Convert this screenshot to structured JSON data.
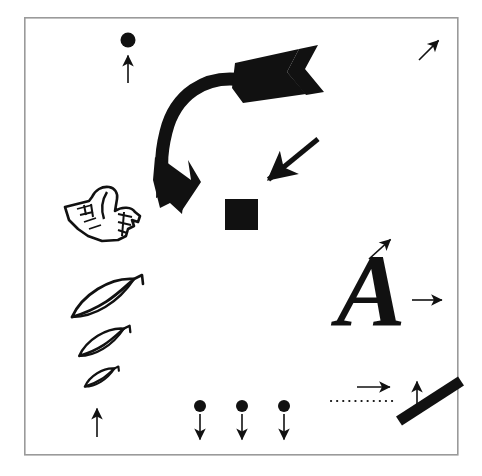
{
  "figure": {
    "background_color": "#ffffff",
    "ink_color": "#111111",
    "frame": {
      "name": "figure-border",
      "x": 24,
      "y": 17,
      "width": 434,
      "height": 438,
      "stroke_color": "#9a9a9a",
      "stroke_width": 1.6
    }
  },
  "elements": {
    "dot_top": {
      "label": "filled circle",
      "cx": 128,
      "cy": 40,
      "r": 7.5,
      "color": "#111111"
    },
    "arrow_under_dot_top": {
      "label": "thin arrow pointing up",
      "direction": "up",
      "x1": 128,
      "y1": 83,
      "x2": 128,
      "y2": 54,
      "stroke_width": 1.6
    },
    "arrow_small_topright": {
      "label": "thin arrow pointing up-right",
      "direction": "up-right",
      "x1": 419,
      "y1": 60,
      "x2": 440,
      "y2": 39,
      "stroke_width": 1.6
    },
    "curved_arrow": {
      "label": "large curved arrow with fletching, sweeping from upper right down to lower left",
      "direction": "down-left",
      "stroke_width": 13,
      "head_length": 46,
      "fletch_label": "feathered tail"
    },
    "arrow_thick_diagonal": {
      "label": "thick arrow pointing down-left",
      "direction": "down-left",
      "x1": 318,
      "y1": 139,
      "x2": 263,
      "y2": 184,
      "stroke_width": 5.5
    },
    "square_black": {
      "label": "filled black square",
      "x": 225,
      "y": 199,
      "width": 33,
      "height": 31,
      "color": "#111111"
    },
    "pointing_hand": {
      "label": "manicule pointing hand, index finger pointing left",
      "x": 62,
      "y": 186,
      "width": 80,
      "height": 58
    },
    "leaves": [
      {
        "label": "leaf large",
        "cx": 112,
        "cy": 299,
        "scale": 1.0
      },
      {
        "label": "leaf medium",
        "cx": 108,
        "cy": 343,
        "scale": 0.72
      },
      {
        "label": "leaf small",
        "cx": 104,
        "cy": 378,
        "scale": 0.48
      }
    ],
    "arrow_under_leaves": {
      "label": "thin arrow pointing up",
      "direction": "up",
      "x1": 97,
      "y1": 437,
      "x2": 97,
      "y2": 407,
      "stroke_width": 1.6
    },
    "dot_arrow_pairs": [
      {
        "label": "dot with arrow pointing down",
        "cx": 200,
        "cy": 406,
        "r": 6.0,
        "y1": 414,
        "y2": 441
      },
      {
        "label": "dot with arrow pointing down",
        "cx": 242,
        "cy": 406,
        "r": 6.0,
        "y1": 414,
        "y2": 441
      },
      {
        "label": "dot with arrow pointing down",
        "cx": 284,
        "cy": 406,
        "r": 6.0,
        "y1": 414,
        "y2": 441
      }
    ],
    "letter_a": {
      "label": "italic serif capital letter A",
      "text": "A",
      "x": 371,
      "y": 326,
      "font_size": 104
    },
    "arrow_above_letter_a": {
      "label": "thin arrow pointing up-right",
      "direction": "up-right",
      "x1": 369,
      "y1": 259,
      "x2": 392,
      "y2": 238,
      "stroke_width": 1.6
    },
    "arrow_right_of_letter_a": {
      "label": "thin arrow pointing right",
      "direction": "right",
      "x1": 412,
      "y1": 300,
      "x2": 444,
      "y2": 300,
      "stroke_width": 1.6
    },
    "arrow_right_lower": {
      "label": "thin arrow pointing right",
      "direction": "right",
      "x1": 357,
      "y1": 387,
      "x2": 392,
      "y2": 387,
      "stroke_width": 1.6
    },
    "dotted_line": {
      "label": "horizontal dotted line",
      "x1": 331,
      "x2": 398,
      "y": 401,
      "dot_count": 12,
      "stroke_width": 2.2
    },
    "arrow_up_lower_right": {
      "label": "thin arrow pointing up",
      "direction": "up",
      "x1": 417,
      "y1": 411,
      "x2": 417,
      "y2": 380,
      "stroke_width": 1.6
    },
    "thick_bar": {
      "label": "thick diagonal bar",
      "x1": 399,
      "y1": 421,
      "x2": 461,
      "y2": 381,
      "stroke_width": 11
    }
  }
}
